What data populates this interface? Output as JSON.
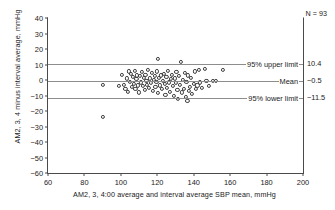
{
  "chart_data": {
    "type": "scatter",
    "title": "",
    "xlabel": "AM2, 3, 4:00 average and interval average SBP mean, mmHg",
    "ylabel": "AM2, 3, 4 minus interval average, mmHg",
    "xlim": [
      60,
      200
    ],
    "ylim": [
      -60,
      40
    ],
    "xticks": [
      60,
      80,
      100,
      120,
      140,
      160,
      180,
      200
    ],
    "yticks": [
      40,
      30,
      20,
      10,
      0,
      -10,
      -20,
      -30,
      -40,
      -50,
      -60
    ],
    "grid": false,
    "legend_position": "none",
    "n_label": "N = 93",
    "n_value": 93,
    "reference_lines": [
      {
        "label": "95% upper limit",
        "value": 10.4,
        "value_label": "10.4"
      },
      {
        "label": "Mean",
        "value": -0.5,
        "value_label": "−0.5"
      },
      {
        "label": "95% lower limit",
        "value": -11.5,
        "value_label": "−11.5"
      }
    ],
    "points": [
      [
        90.0,
        -3.0
      ],
      [
        90.2,
        -24.0
      ],
      [
        99.0,
        -4.0
      ],
      [
        100.5,
        3.5
      ],
      [
        101.5,
        -3.0
      ],
      [
        102.5,
        -5.5
      ],
      [
        103.5,
        1.0
      ],
      [
        104.0,
        -7.5
      ],
      [
        104.5,
        5.5
      ],
      [
        105.0,
        -1.0
      ],
      [
        105.5,
        4.0
      ],
      [
        106.0,
        -4.5
      ],
      [
        106.5,
        2.0
      ],
      [
        107.0,
        -2.5
      ],
      [
        107.5,
        6.0
      ],
      [
        108.0,
        -6.0
      ],
      [
        108.5,
        0.5
      ],
      [
        109.0,
        3.0
      ],
      [
        109.5,
        -3.5
      ],
      [
        110.0,
        -8.0
      ],
      [
        110.5,
        2.5
      ],
      [
        111.0,
        -1.5
      ],
      [
        111.5,
        5.0
      ],
      [
        112.0,
        -4.0
      ],
      [
        112.5,
        1.5
      ],
      [
        113.0,
        -6.5
      ],
      [
        113.5,
        3.5
      ],
      [
        114.0,
        -0.5
      ],
      [
        114.5,
        -3.0
      ],
      [
        115.0,
        6.5
      ],
      [
        115.5,
        -5.0
      ],
      [
        116.0,
        1.0
      ],
      [
        116.5,
        -2.0
      ],
      [
        117.0,
        4.5
      ],
      [
        117.5,
        -7.0
      ],
      [
        118.0,
        0.0
      ],
      [
        118.5,
        2.5
      ],
      [
        119.0,
        -4.5
      ],
      [
        119.5,
        -1.0
      ],
      [
        120.0,
        5.5
      ],
      [
        120.2,
        13.5
      ],
      [
        120.5,
        -8.5
      ],
      [
        121.0,
        1.5
      ],
      [
        121.5,
        -3.5
      ],
      [
        122.0,
        3.0
      ],
      [
        122.5,
        -6.0
      ],
      [
        123.0,
        -0.5
      ],
      [
        123.5,
        4.0
      ],
      [
        124.0,
        -2.5
      ],
      [
        124.5,
        -9.5
      ],
      [
        125.0,
        2.0
      ],
      [
        125.5,
        -5.0
      ],
      [
        126.0,
        6.0
      ],
      [
        126.5,
        -1.5
      ],
      [
        127.0,
        -7.5
      ],
      [
        127.5,
        0.5
      ],
      [
        128.0,
        3.5
      ],
      [
        128.5,
        -4.0
      ],
      [
        129.0,
        -10.5
      ],
      [
        129.5,
        1.0
      ],
      [
        130.0,
        -2.0
      ],
      [
        130.5,
        5.0
      ],
      [
        131.0,
        -6.5
      ],
      [
        131.5,
        -12.0
      ],
      [
        132.0,
        2.5
      ],
      [
        132.5,
        -3.0
      ],
      [
        133.0,
        11.5
      ],
      [
        133.5,
        -8.0
      ],
      [
        134.0,
        0.0
      ],
      [
        134.5,
        -5.5
      ],
      [
        135.0,
        4.5
      ],
      [
        135.5,
        -11.0
      ],
      [
        136.0,
        -1.0
      ],
      [
        136.5,
        -13.5
      ],
      [
        137.0,
        3.0
      ],
      [
        137.5,
        -7.0
      ],
      [
        138.0,
        -4.5
      ],
      [
        138.5,
        1.5
      ],
      [
        139.0,
        -9.0
      ],
      [
        140.0,
        -2.5
      ],
      [
        140.5,
        5.5
      ],
      [
        141.0,
        -6.0
      ],
      [
        142.0,
        -3.5
      ],
      [
        143.0,
        6.5
      ],
      [
        143.5,
        -1.5
      ],
      [
        144.5,
        -5.0
      ],
      [
        146.0,
        7.0
      ],
      [
        147.0,
        -0.5
      ],
      [
        148.5,
        -4.0
      ],
      [
        150.5,
        -0.5
      ],
      [
        152.0,
        -0.5
      ],
      [
        156.0,
        6.5
      ]
    ]
  }
}
